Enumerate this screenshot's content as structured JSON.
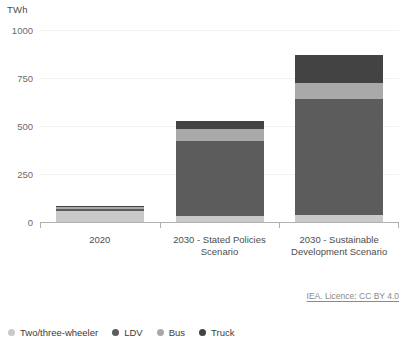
{
  "chart_data": {
    "type": "bar",
    "subtype": "stacked-vertical",
    "title": "",
    "unit_label": "TWh",
    "xlabel": "",
    "ylabel": "TWh",
    "ylim": [
      0,
      1000
    ],
    "yticks": [
      0,
      250,
      500,
      750,
      1000
    ],
    "ytick_labels": [
      "0",
      "250",
      "500",
      "750",
      "1000"
    ],
    "grid": true,
    "grid_axis": "y",
    "legend_position": "bottom-left",
    "categories": [
      "2020",
      "2030 - Stated Policies Scenario",
      "2030 - Sustainable Development Scenario"
    ],
    "category_labels": [
      "2020",
      "2030 - Stated Policies\nScenario",
      "2030 - Sustainable\nDevelopment Scenario"
    ],
    "series": [
      {
        "name": "Two/three-wheeler",
        "color": "#c9c9c9",
        "values": [
          55,
          30,
          35
        ]
      },
      {
        "name": "LDV",
        "color": "#5c5c5c",
        "values": [
          15,
          390,
          605
        ]
      },
      {
        "name": "Bus",
        "color": "#a9a9a9",
        "values": [
          8,
          65,
          85
        ]
      },
      {
        "name": "Truck",
        "color": "#434343",
        "values": [
          7,
          40,
          145
        ]
      }
    ],
    "totals": [
      85,
      525,
      870
    ],
    "annotations": [
      {
        "name": "attribution",
        "text": "IEA. Licence: CC BY 4.0"
      }
    ]
  },
  "legend": {
    "items": [
      {
        "label": "Two/three-wheeler",
        "color": "#c9c9c9"
      },
      {
        "label": "LDV",
        "color": "#5c5c5c"
      },
      {
        "label": "Bus",
        "color": "#a9a9a9"
      },
      {
        "label": "Truck",
        "color": "#434343"
      }
    ]
  },
  "attribution": {
    "text": "IEA. Licence: CC BY 4.0"
  },
  "colors": {
    "two_three_wheeler": "#c9c9c9",
    "ldv": "#5c5c5c",
    "bus": "#a9a9a9",
    "truck": "#434343",
    "gridline": "#f2f2f2",
    "axis": "#b0b0b0",
    "text": "#4d4d4d"
  }
}
